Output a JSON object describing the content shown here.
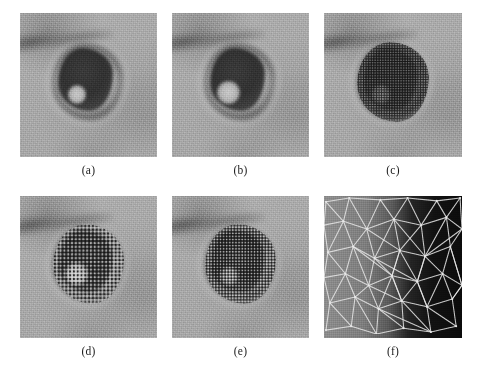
{
  "figure": {
    "layout": {
      "rows": 2,
      "columns": 3
    },
    "background_color": "#ffffff",
    "panels": [
      {
        "id": "a",
        "caption": "(a)",
        "kind": "micrograph",
        "description": "grayscale electron micrograph of a virion with dark capsid core and pale halo",
        "stippled": false,
        "lacuna": "small"
      },
      {
        "id": "b",
        "caption": "(b)",
        "kind": "micrograph",
        "description": "same virion, slightly smoother rendering with larger bright lacuna",
        "stippled": false,
        "lacuna": "large"
      },
      {
        "id": "c",
        "caption": "(c)",
        "kind": "micrograph",
        "description": "virion overlaid with dense sampled point stipple pattern",
        "stippled": true,
        "stipple_density": "fine",
        "lacuna": "small"
      },
      {
        "id": "d",
        "caption": "(d)",
        "kind": "micrograph",
        "description": "virion overlaid with coarser sampled point stipple pattern",
        "stippled": true,
        "stipple_density": "coarse",
        "lacuna": "large"
      },
      {
        "id": "e",
        "caption": "(e)",
        "kind": "micrograph",
        "description": "virion overlaid with medium sampled point stipple pattern",
        "stippled": true,
        "stipple_density": "medium",
        "lacuna": "small"
      },
      {
        "id": "f",
        "caption": "(f)",
        "kind": "mesh",
        "description": "zoomed detail showing white Delaunay triangulation mesh over a dark-to-light intensity gradient",
        "mesh_line_color": "#e8e8e8",
        "background_gradient": [
          "#8e8e8e",
          "#0b0b0b"
        ]
      }
    ],
    "colors": {
      "page_background": "#ffffff",
      "panel_midtone": "#a9a9a9",
      "panel_core_dark": "#313131",
      "mesh_line": "#e8e8e8",
      "caption_text": "#1a1a1a"
    },
    "mesh_data": {
      "type": "triangulation",
      "vertices": [
        [
          2,
          6
        ],
        [
          26,
          2
        ],
        [
          58,
          4
        ],
        [
          86,
          2
        ],
        [
          116,
          5
        ],
        [
          140,
          2
        ],
        [
          0,
          30
        ],
        [
          20,
          26
        ],
        [
          44,
          34
        ],
        [
          72,
          24
        ],
        [
          100,
          30
        ],
        [
          126,
          22
        ],
        [
          142,
          34
        ],
        [
          4,
          58
        ],
        [
          30,
          52
        ],
        [
          52,
          64
        ],
        [
          78,
          56
        ],
        [
          104,
          62
        ],
        [
          130,
          52
        ],
        [
          0,
          84
        ],
        [
          22,
          80
        ],
        [
          46,
          92
        ],
        [
          70,
          82
        ],
        [
          96,
          88
        ],
        [
          122,
          80
        ],
        [
          142,
          92
        ],
        [
          6,
          110
        ],
        [
          32,
          104
        ],
        [
          56,
          116
        ],
        [
          80,
          108
        ],
        [
          106,
          114
        ],
        [
          132,
          106
        ],
        [
          2,
          138
        ],
        [
          28,
          134
        ],
        [
          54,
          142
        ],
        [
          82,
          136
        ],
        [
          110,
          140
        ],
        [
          136,
          134
        ]
      ],
      "edges": [
        [
          0,
          1
        ],
        [
          1,
          2
        ],
        [
          2,
          3
        ],
        [
          3,
          4
        ],
        [
          4,
          5
        ],
        [
          6,
          7
        ],
        [
          7,
          8
        ],
        [
          8,
          9
        ],
        [
          9,
          10
        ],
        [
          10,
          11
        ],
        [
          11,
          12
        ],
        [
          13,
          14
        ],
        [
          14,
          15
        ],
        [
          15,
          16
        ],
        [
          16,
          17
        ],
        [
          17,
          18
        ],
        [
          19,
          20
        ],
        [
          20,
          21
        ],
        [
          21,
          22
        ],
        [
          22,
          23
        ],
        [
          23,
          24
        ],
        [
          24,
          25
        ],
        [
          26,
          27
        ],
        [
          27,
          28
        ],
        [
          28,
          29
        ],
        [
          29,
          30
        ],
        [
          30,
          31
        ],
        [
          32,
          33
        ],
        [
          33,
          34
        ],
        [
          34,
          35
        ],
        [
          35,
          36
        ],
        [
          36,
          37
        ],
        [
          0,
          6
        ],
        [
          1,
          7
        ],
        [
          2,
          8
        ],
        [
          3,
          9
        ],
        [
          4,
          10
        ],
        [
          5,
          11
        ],
        [
          5,
          12
        ],
        [
          6,
          13
        ],
        [
          7,
          14
        ],
        [
          8,
          15
        ],
        [
          9,
          16
        ],
        [
          10,
          17
        ],
        [
          11,
          18
        ],
        [
          12,
          18
        ],
        [
          13,
          19
        ],
        [
          14,
          20
        ],
        [
          15,
          21
        ],
        [
          16,
          22
        ],
        [
          17,
          23
        ],
        [
          18,
          24
        ],
        [
          18,
          25
        ],
        [
          19,
          26
        ],
        [
          20,
          27
        ],
        [
          21,
          28
        ],
        [
          22,
          29
        ],
        [
          23,
          30
        ],
        [
          24,
          31
        ],
        [
          25,
          31
        ],
        [
          26,
          32
        ],
        [
          27,
          33
        ],
        [
          28,
          34
        ],
        [
          29,
          35
        ],
        [
          30,
          36
        ],
        [
          31,
          37
        ],
        [
          0,
          7
        ],
        [
          1,
          8
        ],
        [
          2,
          9
        ],
        [
          3,
          10
        ],
        [
          4,
          11
        ],
        [
          7,
          13
        ],
        [
          8,
          14
        ],
        [
          9,
          15
        ],
        [
          10,
          16
        ],
        [
          11,
          17
        ],
        [
          12,
          17
        ],
        [
          13,
          20
        ],
        [
          14,
          21
        ],
        [
          15,
          22
        ],
        [
          16,
          23
        ],
        [
          17,
          24
        ],
        [
          18,
          25
        ],
        [
          20,
          26
        ],
        [
          21,
          27
        ],
        [
          22,
          28
        ],
        [
          23,
          29
        ],
        [
          24,
          30
        ],
        [
          25,
          31
        ],
        [
          26,
          33
        ],
        [
          27,
          34
        ],
        [
          28,
          35
        ],
        [
          29,
          36
        ],
        [
          30,
          37
        ],
        [
          8,
          16
        ],
        [
          9,
          17
        ],
        [
          16,
          22
        ],
        [
          17,
          23
        ],
        [
          22,
          29
        ],
        [
          23,
          30
        ],
        [
          14,
          22
        ],
        [
          15,
          23
        ],
        [
          21,
          29
        ],
        [
          28,
          36
        ]
      ]
    }
  }
}
